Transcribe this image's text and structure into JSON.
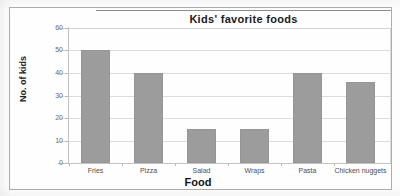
{
  "chart_data": {
    "type": "bar",
    "title": "Kids' favorite foods",
    "xlabel": "Food",
    "ylabel": "No. of kids",
    "categories": [
      "Fries",
      "Pizza",
      "Salad",
      "Wraps",
      "Pasta",
      "Chicken nuggets"
    ],
    "values": [
      50,
      40,
      15,
      15,
      40,
      36
    ],
    "ylim": [
      0,
      60
    ],
    "ytick_labels": [
      "0",
      "10",
      "20",
      "30",
      "40",
      "50",
      "60"
    ],
    "ytick_values": [
      0,
      10,
      20,
      30,
      40,
      50,
      60
    ],
    "grid": true,
    "legend": false,
    "bar_color": "#9c9c9c",
    "gridline_color": "#dcdcdc",
    "axis_color": "#c2c2c2"
  }
}
